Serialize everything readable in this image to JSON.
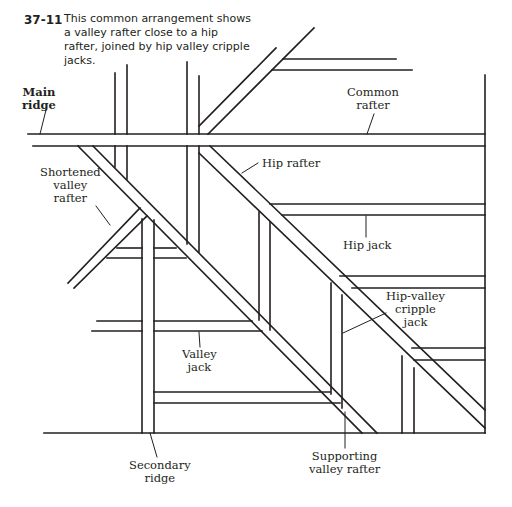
{
  "caption": {
    "figure_number": "37-11",
    "text": "This common arrangement shows a valley rafter close to a hip rafter, joined by hip valley cripple jacks."
  },
  "labels": {
    "main_ridge_1": "Main",
    "main_ridge_2": "ridge",
    "common_rafter_1": "Common",
    "common_rafter_2": "rafter",
    "hip_rafter": "Hip rafter",
    "shortened_valley_rafter_1": "Shortened",
    "shortened_valley_rafter_2": "valley",
    "shortened_valley_rafter_3": "rafter",
    "hip_jack": "Hip jack",
    "hip_valley_cripple_jack_1": "Hip-valley",
    "hip_valley_cripple_jack_2": "cripple",
    "hip_valley_cripple_jack_3": "jack",
    "valley_jack_1": "Valley",
    "valley_jack_2": "jack",
    "secondary_ridge_1": "Secondary",
    "secondary_ridge_2": "ridge",
    "supporting_valley_rafter_1": "Supporting",
    "supporting_valley_rafter_2": "valley rafter"
  },
  "colors": {
    "line": "#231f20",
    "background": "#ffffff"
  }
}
